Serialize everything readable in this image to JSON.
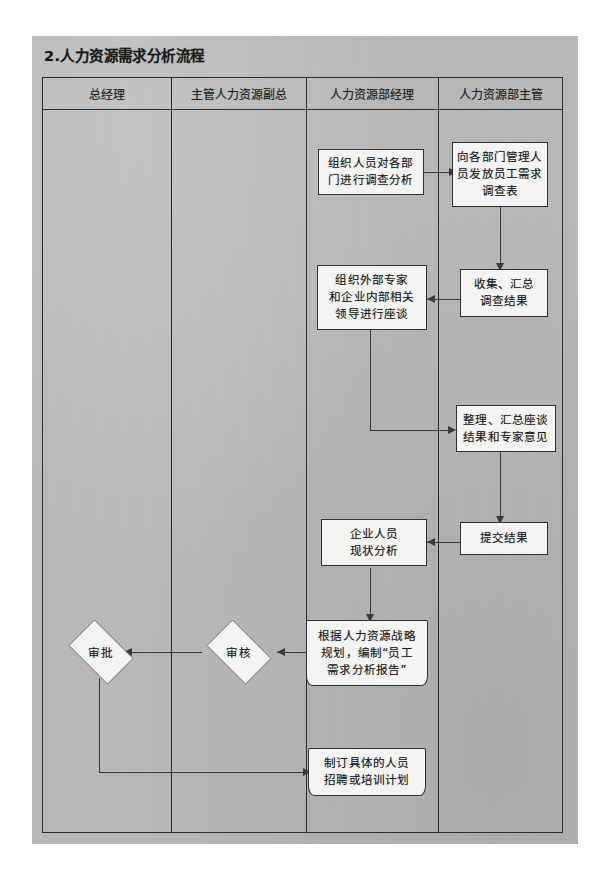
{
  "document": {
    "title": "2.人力资源需求分析流程",
    "background_color": "#b9b9b9",
    "line_color": "#303030"
  },
  "table": {
    "columns": [
      {
        "label": "总经理"
      },
      {
        "label": "主管人力资源副总"
      },
      {
        "label": "人力资源部经理"
      },
      {
        "label": "人力资源部主管"
      }
    ]
  },
  "flowchart": {
    "nodes": [
      {
        "id": "n1",
        "column": "人力资源部经理",
        "shape": "rectangle",
        "lines": [
          "组织人员对各部",
          "门进行调查分析"
        ]
      },
      {
        "id": "n2",
        "column": "人力资源部主管",
        "shape": "rectangle",
        "lines": [
          "向各部门管理人",
          "员发放员工需求",
          "调查表"
        ]
      },
      {
        "id": "n3",
        "column": "人力资源部经理",
        "shape": "rectangle",
        "lines": [
          "组织外部专家",
          "和企业内部相关",
          "领导进行座谈"
        ]
      },
      {
        "id": "n4",
        "column": "人力资源部主管",
        "shape": "rectangle",
        "lines": [
          "收集、汇总",
          "调查结果"
        ]
      },
      {
        "id": "n5",
        "column": "人力资源部主管",
        "shape": "rectangle",
        "lines": [
          "整理、汇总座谈",
          "结果和专家意见"
        ]
      },
      {
        "id": "n6",
        "column": "人力资源部主管",
        "shape": "rectangle",
        "lines": [
          "提交结果"
        ]
      },
      {
        "id": "n7",
        "column": "人力资源部经理",
        "shape": "rectangle",
        "lines": [
          "企业人员",
          "现状分析"
        ]
      },
      {
        "id": "n8",
        "column": "人力资源部经理",
        "shape": "document",
        "lines": [
          "根据人力资源战略",
          "规划，编制“员工",
          "需求分析报告”"
        ]
      },
      {
        "id": "n9",
        "column": "主管人力资源副总",
        "shape": "diamond",
        "lines": [
          "审核"
        ]
      },
      {
        "id": "n10",
        "column": "总经理",
        "shape": "diamond",
        "lines": [
          "审批"
        ]
      },
      {
        "id": "n11",
        "column": "人力资源部经理",
        "shape": "document",
        "lines": [
          "制订具体的人员",
          "招聘或培训计划"
        ]
      }
    ],
    "edges": [
      {
        "from": "n1",
        "to": "n2",
        "direction": "right"
      },
      {
        "from": "n2",
        "to": "n4",
        "direction": "down"
      },
      {
        "from": "n4",
        "to": "n3",
        "direction": "left"
      },
      {
        "from": "n3",
        "to": "n5",
        "direction": "right"
      },
      {
        "from": "n5",
        "to": "n6",
        "direction": "down"
      },
      {
        "from": "n6",
        "to": "n7",
        "direction": "left"
      },
      {
        "from": "n7",
        "to": "n8",
        "direction": "down"
      },
      {
        "from": "n8",
        "to": "n9",
        "direction": "left"
      },
      {
        "from": "n9",
        "to": "n10",
        "direction": "left"
      },
      {
        "from": "n10",
        "to": "n11",
        "direction": "right"
      }
    ]
  }
}
